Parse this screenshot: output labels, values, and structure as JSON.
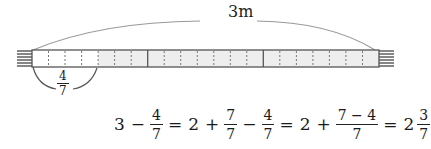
{
  "diagram": {
    "total_length_label": "3m",
    "total_meters": 3,
    "divisions_per_meter": 7,
    "cut_part": {
      "numerator": "4",
      "denominator": "7"
    },
    "colors": {
      "bar_fill_remaining": "#eeeeee",
      "bar_fill_cut": "#ffffff",
      "bar_outline": "#555555",
      "meter_divider": "#555555",
      "tick_dashed": "#777777",
      "end_caps": "#444444",
      "arc": "#999999",
      "brace": "#555555"
    }
  },
  "equation": {
    "whole": "3",
    "minus1": "−",
    "f1": {
      "num": "4",
      "den": "7"
    },
    "eq1": "=",
    "two_a": "2",
    "plus1": "+",
    "f2": {
      "num": "7",
      "den": "7"
    },
    "minus2": "−",
    "f3": {
      "num": "4",
      "den": "7"
    },
    "eq2": "=",
    "two_b": "2",
    "plus2": "+",
    "f4": {
      "num": "7 − 4",
      "den": "7"
    },
    "eq3": "=",
    "result_whole": "2",
    "result_frac": {
      "num": "3",
      "den": "7"
    }
  }
}
